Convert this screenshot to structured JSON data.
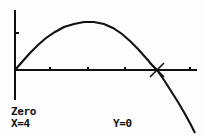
{
  "screen": {
    "width": 203,
    "height": 136,
    "background_color": "#fdfdfd",
    "ink_color": "#111111"
  },
  "readout": {
    "operation_label": "Zero",
    "x_label": "X=4",
    "y_label": "Y=0"
  },
  "cursor": {
    "name": "zero-crosshair-cursor",
    "glyph": "x-crosshair",
    "px": 157,
    "py": 70,
    "x_value": 4,
    "y_value": 0
  },
  "chart_data": {
    "type": "line",
    "title": "",
    "subtitle": "",
    "xlabel": "",
    "ylabel": "",
    "grid": false,
    "legend": null,
    "axes": {
      "x_axis_py": 70,
      "y_axis_px": 15,
      "y_axis_top_py": 10,
      "y_axis_bottom_py": 100,
      "x_axis_left_px": 15,
      "x_axis_right_px": 197,
      "x_tick_px": [
        50,
        88,
        125,
        190
      ],
      "y_tick_py": [
        33
      ]
    },
    "annotations": [
      {
        "label": "Zero",
        "x": 4,
        "y": 0
      }
    ],
    "series": [
      {
        "name": "y1",
        "comment": "downward parabola through origin and x=4",
        "points_px": [
          [
            15,
            70
          ],
          [
            22,
            62
          ],
          [
            30,
            53
          ],
          [
            38,
            45
          ],
          [
            46,
            38
          ],
          [
            55,
            32
          ],
          [
            64,
            27
          ],
          [
            74,
            24
          ],
          [
            84,
            22
          ],
          [
            94,
            22
          ],
          [
            104,
            24
          ],
          [
            113,
            28
          ],
          [
            122,
            34
          ],
          [
            130,
            41
          ],
          [
            138,
            49
          ],
          [
            146,
            58
          ],
          [
            152,
            65
          ],
          [
            157,
            70
          ],
          [
            164,
            80
          ],
          [
            171,
            91
          ],
          [
            178,
            102
          ],
          [
            185,
            114
          ],
          [
            191,
            125
          ],
          [
            195,
            133
          ]
        ]
      }
    ]
  }
}
